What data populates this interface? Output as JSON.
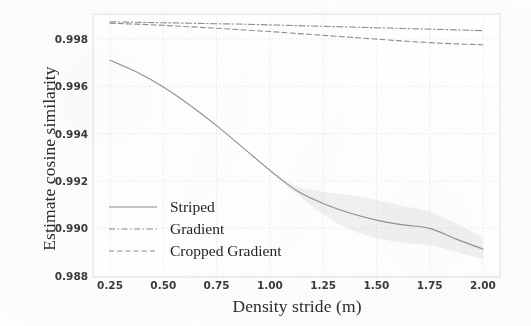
{
  "chart_data": {
    "type": "line",
    "title": "",
    "xlabel": "Density stride (m)",
    "ylabel": "Estimate cosine similarity",
    "xlim": [
      0.17,
      2.08
    ],
    "ylim": [
      0.98795,
      0.99905
    ],
    "xticks": [
      "0.25",
      "0.50",
      "0.75",
      "1.00",
      "1.25",
      "1.50",
      "1.75",
      "2.00"
    ],
    "xtick_values": [
      0.25,
      0.5,
      0.75,
      1.0,
      1.25,
      1.5,
      1.75,
      2.0
    ],
    "yticks": [
      "0.998",
      "0.996",
      "0.994",
      "0.992",
      "0.990",
      "0.988"
    ],
    "ytick_values": [
      0.998,
      0.996,
      0.994,
      0.992,
      0.99,
      0.988
    ],
    "grid": true,
    "grid_style": "dotted",
    "legend_position": "lower-left-inside",
    "x": [
      0.25,
      0.375,
      0.5,
      0.625,
      0.75,
      0.875,
      1.0,
      1.125,
      1.25,
      1.375,
      1.5,
      1.625,
      1.75,
      1.875,
      2.0
    ],
    "series": [
      {
        "name": "Striped",
        "linestyle": "solid",
        "color": "#8c8c8c",
        "values": [
          0.9971,
          0.9966,
          0.99597,
          0.9952,
          0.99434,
          0.9934,
          0.99245,
          0.9916,
          0.99105,
          0.99065,
          0.99035,
          0.99015,
          0.99,
          0.98955,
          0.98913
        ],
        "band_lower": [
          0.9971,
          0.9966,
          0.99597,
          0.9952,
          0.99434,
          0.9934,
          0.9924,
          0.99145,
          0.9906,
          0.98995,
          0.9896,
          0.9894,
          0.9893,
          0.989,
          0.9887
        ],
        "band_upper": [
          0.9971,
          0.9966,
          0.99597,
          0.9952,
          0.99434,
          0.9934,
          0.9925,
          0.99178,
          0.99155,
          0.9914,
          0.9912,
          0.99095,
          0.9907,
          0.9902,
          0.9896
        ]
      },
      {
        "name": "Gradient",
        "linestyle": "dashdot",
        "color": "#8c8c8c",
        "values": [
          0.99872,
          0.9987,
          0.99868,
          0.99866,
          0.99864,
          0.99862,
          0.99859,
          0.99856,
          0.99853,
          0.9985,
          0.99847,
          0.99844,
          0.99841,
          0.99838,
          0.99835
        ]
      },
      {
        "name": "Cropped Gradient",
        "linestyle": "dashed",
        "color": "#8c8c8c",
        "values": [
          0.99866,
          0.99862,
          0.99857,
          0.99851,
          0.99845,
          0.99838,
          0.99831,
          0.99823,
          0.99815,
          0.99807,
          0.99799,
          0.99791,
          0.99784,
          0.99779,
          0.99775
        ]
      }
    ]
  },
  "legend": {
    "items": [
      {
        "label": "Striped",
        "style": "solid"
      },
      {
        "label": "Gradient",
        "style": "dashdot"
      },
      {
        "label": "Cropped Gradient",
        "style": "dashed"
      }
    ]
  }
}
